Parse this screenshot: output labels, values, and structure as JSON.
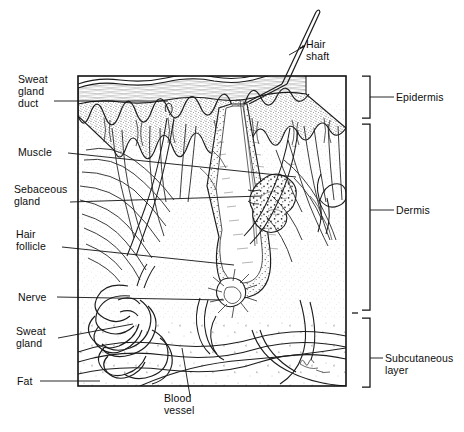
{
  "figure": {
    "type": "anatomical-line-diagram",
    "ink_color": "#111111",
    "background_color": "#ffffff"
  },
  "labels": {
    "hair_shaft": "Hair\nshaft",
    "sweat_gland_duct": "Sweat\ngland\nduct",
    "muscle": "Muscle",
    "sebaceous_gland": "Sebaceous\ngland",
    "hair_follicle": "Hair\nfollicle",
    "nerve": "Nerve",
    "sweat_gland": "Sweat\ngland",
    "fat": "Fat",
    "blood_vessel": "Blood\nvessel",
    "epidermis": "Epidermis",
    "dermis": "Dermis",
    "subcutaneous_layer": "Subcutaneous\nlayer"
  },
  "layers": [
    {
      "name": "Epidermis",
      "bracket_top": 76,
      "bracket_bottom": 118
    },
    {
      "name": "Dermis",
      "bracket_top": 124,
      "bracket_bottom": 310
    },
    {
      "name": "Subcutaneous layer",
      "bracket_top": 318,
      "bracket_bottom": 387
    }
  ],
  "structures": [
    "hair shaft",
    "stratum corneum",
    "epidermis",
    "rete ridges",
    "arrector pili muscle",
    "sebaceous gland",
    "hair follicle",
    "hair bulb",
    "dermal papilla",
    "nerve",
    "eccrine sweat gland",
    "sweat gland duct",
    "blood vessel",
    "subcutaneous fat"
  ]
}
